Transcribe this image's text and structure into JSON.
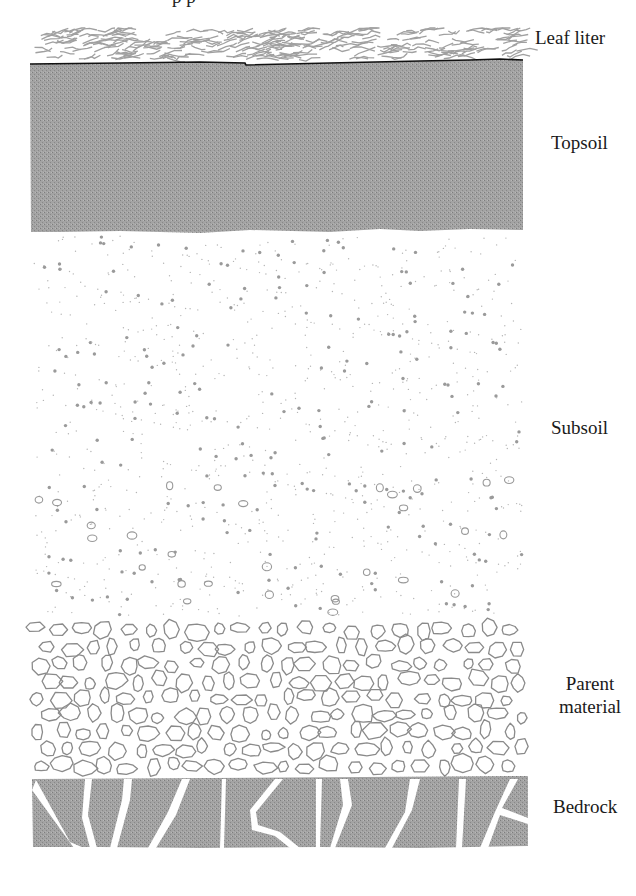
{
  "diagram": {
    "title_cutoff": "p p",
    "layers": [
      {
        "id": "leaf-litter",
        "label": "Leaf liter",
        "top": 28,
        "bottom": 64,
        "fill": "#ffffff",
        "texture": "leaf-scribble",
        "texture_color": "#9e9e9e"
      },
      {
        "id": "topsoil",
        "label": "Topsoil",
        "top": 64,
        "bottom": 232,
        "fill": "#9a9a9a",
        "texture": "stipple"
      },
      {
        "id": "subsoil",
        "label": "Subsoil",
        "top": 232,
        "bottom": 620,
        "fill": "#ffffff",
        "texture": "dots",
        "texture_color": "#a0a0a0"
      },
      {
        "id": "parent-material",
        "label_lines": [
          "Parent",
          "material"
        ],
        "top": 620,
        "bottom": 776,
        "fill": "#ffffff",
        "texture": "pebbles",
        "texture_color": "#8a8a8a"
      },
      {
        "id": "bedrock",
        "label": "Bedrock",
        "top": 776,
        "bottom": 848,
        "fill": "#9a9a9a",
        "texture": "cracks"
      }
    ],
    "column": {
      "left": 30,
      "right": 526
    },
    "colors": {
      "boundary_line": "#111111",
      "label_text": "#1a1a1a",
      "gray": "#9a9a9a"
    }
  }
}
